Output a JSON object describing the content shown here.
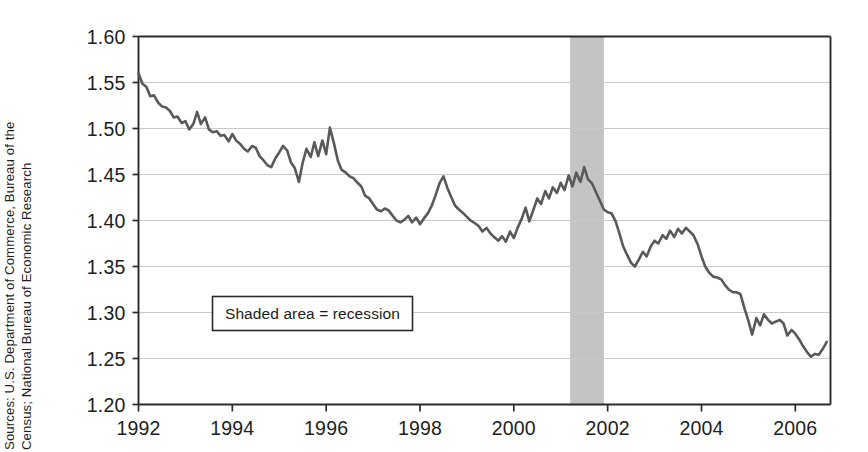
{
  "figure": {
    "source_note_line1": "Sources: U.S. Department of Commerce, Bureau of the",
    "source_note_line2": "Census; National Bureau of Economic Research"
  },
  "chart_data": {
    "type": "line",
    "title": "",
    "subtitle": "",
    "xlabel": "",
    "ylabel": "",
    "xlim": [
      1992.0,
      2006.75
    ],
    "ylim": [
      1.2,
      1.6
    ],
    "grid": true,
    "grid_axis": "y",
    "legend": {
      "position": "inside-left",
      "entries": [
        {
          "label": "Shaded area = recession",
          "swatch": "#c4c4c4"
        }
      ]
    },
    "annotations": [
      {
        "type": "vspan",
        "label": "recession",
        "x_start": 2001.2,
        "x_end": 2001.92,
        "color": "#c4c4c4"
      }
    ],
    "ytick_labels": [
      "1.20",
      "1.25",
      "1.30",
      "1.35",
      "1.40",
      "1.45",
      "1.50",
      "1.55",
      "1.60"
    ],
    "ytick_values": [
      1.2,
      1.25,
      1.3,
      1.35,
      1.4,
      1.45,
      1.5,
      1.55,
      1.6
    ],
    "xtick_labels": [
      "1992",
      "1994",
      "1996",
      "1998",
      "2000",
      "2002",
      "2004",
      "2006"
    ],
    "xtick_values": [
      1992,
      1994,
      1996,
      1998,
      2000,
      2002,
      2004,
      2006
    ],
    "series": [
      {
        "name": "ratio",
        "color": "#595959",
        "line_width": 2.6,
        "x": [
          1992.0,
          1992.08,
          1992.17,
          1992.25,
          1992.33,
          1992.42,
          1992.5,
          1992.58,
          1992.67,
          1992.75,
          1992.83,
          1992.92,
          1993.0,
          1993.08,
          1993.17,
          1993.25,
          1993.33,
          1993.42,
          1993.5,
          1993.58,
          1993.67,
          1993.75,
          1993.83,
          1993.92,
          1994.0,
          1994.08,
          1994.17,
          1994.25,
          1994.33,
          1994.42,
          1994.5,
          1994.58,
          1994.67,
          1994.75,
          1994.83,
          1994.92,
          1995.0,
          1995.08,
          1995.17,
          1995.25,
          1995.33,
          1995.42,
          1995.5,
          1995.58,
          1995.67,
          1995.75,
          1995.83,
          1995.92,
          1996.0,
          1996.08,
          1996.17,
          1996.25,
          1996.33,
          1996.42,
          1996.5,
          1996.58,
          1996.67,
          1996.75,
          1996.83,
          1996.92,
          1997.0,
          1997.08,
          1997.17,
          1997.25,
          1997.33,
          1997.42,
          1997.5,
          1997.58,
          1997.67,
          1997.75,
          1997.83,
          1997.92,
          1998.0,
          1998.08,
          1998.17,
          1998.25,
          1998.33,
          1998.42,
          1998.5,
          1998.58,
          1998.67,
          1998.75,
          1998.83,
          1998.92,
          1999.0,
          1999.08,
          1999.17,
          1999.25,
          1999.33,
          1999.42,
          1999.5,
          1999.58,
          1999.67,
          1999.75,
          1999.83,
          1999.92,
          2000.0,
          2000.08,
          2000.17,
          2000.25,
          2000.33,
          2000.42,
          2000.5,
          2000.58,
          2000.67,
          2000.75,
          2000.83,
          2000.92,
          2001.0,
          2001.08,
          2001.17,
          2001.25,
          2001.33,
          2001.42,
          2001.5,
          2001.58,
          2001.67,
          2001.75,
          2001.83,
          2001.92,
          2002.0,
          2002.08,
          2002.17,
          2002.25,
          2002.33,
          2002.42,
          2002.5,
          2002.58,
          2002.67,
          2002.75,
          2002.83,
          2002.92,
          2003.0,
          2003.08,
          2003.17,
          2003.25,
          2003.33,
          2003.42,
          2003.5,
          2003.58,
          2003.67,
          2003.75,
          2003.83,
          2003.92,
          2004.0,
          2004.08,
          2004.17,
          2004.25,
          2004.33,
          2004.42,
          2004.5,
          2004.58,
          2004.67,
          2004.75,
          2004.83,
          2004.92,
          2005.0,
          2005.08,
          2005.17,
          2005.25,
          2005.33,
          2005.42,
          2005.5,
          2005.58,
          2005.67,
          2005.75,
          2005.83,
          2005.92,
          2006.0,
          2006.08,
          2006.17,
          2006.25,
          2006.33,
          2006.42,
          2006.5,
          2006.58,
          2006.67
        ],
        "values": [
          1.56,
          1.549,
          1.545,
          1.535,
          1.536,
          1.528,
          1.524,
          1.523,
          1.519,
          1.512,
          1.513,
          1.506,
          1.508,
          1.499,
          1.505,
          1.518,
          1.505,
          1.512,
          1.499,
          1.496,
          1.497,
          1.492,
          1.493,
          1.486,
          1.494,
          1.487,
          1.483,
          1.478,
          1.475,
          1.481,
          1.479,
          1.47,
          1.465,
          1.46,
          1.458,
          1.468,
          1.474,
          1.481,
          1.476,
          1.463,
          1.457,
          1.442,
          1.463,
          1.478,
          1.469,
          1.485,
          1.47,
          1.487,
          1.472,
          1.501,
          1.483,
          1.465,
          1.455,
          1.452,
          1.448,
          1.446,
          1.441,
          1.437,
          1.427,
          1.424,
          1.418,
          1.412,
          1.41,
          1.413,
          1.411,
          1.405,
          1.4,
          1.398,
          1.401,
          1.405,
          1.398,
          1.403,
          1.396,
          1.402,
          1.408,
          1.416,
          1.427,
          1.441,
          1.448,
          1.436,
          1.425,
          1.416,
          1.412,
          1.408,
          1.404,
          1.4,
          1.397,
          1.394,
          1.388,
          1.392,
          1.386,
          1.382,
          1.378,
          1.383,
          1.377,
          1.388,
          1.381,
          1.392,
          1.402,
          1.414,
          1.399,
          1.412,
          1.424,
          1.418,
          1.432,
          1.424,
          1.436,
          1.43,
          1.441,
          1.433,
          1.449,
          1.437,
          1.452,
          1.442,
          1.458,
          1.445,
          1.44,
          1.431,
          1.422,
          1.412,
          1.409,
          1.408,
          1.399,
          1.386,
          1.372,
          1.362,
          1.354,
          1.35,
          1.358,
          1.366,
          1.361,
          1.372,
          1.378,
          1.375,
          1.384,
          1.38,
          1.389,
          1.382,
          1.391,
          1.386,
          1.392,
          1.388,
          1.384,
          1.374,
          1.361,
          1.35,
          1.343,
          1.339,
          1.338,
          1.336,
          1.33,
          1.325,
          1.322,
          1.322,
          1.32,
          1.304,
          1.291,
          1.276,
          1.294,
          1.286,
          1.298,
          1.292,
          1.288,
          1.29,
          1.292,
          1.288,
          1.275,
          1.281,
          1.277,
          1.271,
          1.263,
          1.257,
          1.252,
          1.255,
          1.254,
          1.26,
          1.268
        ]
      }
    ]
  }
}
